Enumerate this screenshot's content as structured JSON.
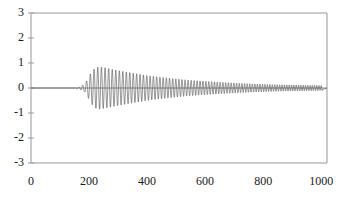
{
  "chart_data": {
    "type": "line",
    "title": "",
    "subtitle": "",
    "xlabel": "",
    "ylabel": "",
    "xlim": [
      0,
      1020
    ],
    "ylim": [
      -3,
      3
    ],
    "grid": false,
    "legend": null,
    "line_color": "#4d4d4d",
    "axis_color": "#999999",
    "background": "#ffffff",
    "x_ticks": [
      {
        "value": 0,
        "label": "0"
      },
      {
        "value": 200,
        "label": "200"
      },
      {
        "value": 400,
        "label": "400"
      },
      {
        "value": 600,
        "label": "600"
      },
      {
        "value": 800,
        "label": "800"
      },
      {
        "value": 1000,
        "label": "1000"
      }
    ],
    "y_ticks": [
      {
        "value": 3,
        "label": "3"
      },
      {
        "value": 2,
        "label": "2"
      },
      {
        "value": 1,
        "label": "1"
      },
      {
        "value": 0,
        "label": "0"
      },
      {
        "value": -1,
        "label": "-1"
      },
      {
        "value": -2,
        "label": "-2"
      },
      {
        "value": -3,
        "label": "-3"
      }
    ],
    "series": [
      {
        "name": "signal",
        "description": "Amplitude-modulated oscillation: quiet until x=165, rapid growth to peak near x=235, then slow decay with frequency increasing toward x=1000",
        "onset_x": 165,
        "peak_x": 235,
        "peak_amplitude": 0.85,
        "end_amplitude": 0.1,
        "envelope_points": [
          {
            "x": 0,
            "a": 0.0
          },
          {
            "x": 150,
            "a": 0.0
          },
          {
            "x": 165,
            "a": 0.04
          },
          {
            "x": 175,
            "a": 0.1
          },
          {
            "x": 185,
            "a": 0.16
          },
          {
            "x": 195,
            "a": 0.35
          },
          {
            "x": 205,
            "a": 0.58
          },
          {
            "x": 215,
            "a": 0.74
          },
          {
            "x": 225,
            "a": 0.82
          },
          {
            "x": 235,
            "a": 0.85
          },
          {
            "x": 250,
            "a": 0.82
          },
          {
            "x": 275,
            "a": 0.76
          },
          {
            "x": 300,
            "a": 0.7
          },
          {
            "x": 330,
            "a": 0.64
          },
          {
            "x": 360,
            "a": 0.58
          },
          {
            "x": 400,
            "a": 0.5
          },
          {
            "x": 440,
            "a": 0.44
          },
          {
            "x": 480,
            "a": 0.39
          },
          {
            "x": 520,
            "a": 0.34
          },
          {
            "x": 560,
            "a": 0.3
          },
          {
            "x": 600,
            "a": 0.27
          },
          {
            "x": 650,
            "a": 0.23
          },
          {
            "x": 700,
            "a": 0.2
          },
          {
            "x": 750,
            "a": 0.17
          },
          {
            "x": 800,
            "a": 0.15
          },
          {
            "x": 850,
            "a": 0.13
          },
          {
            "x": 900,
            "a": 0.12
          },
          {
            "x": 950,
            "a": 0.11
          },
          {
            "x": 1000,
            "a": 0.1
          }
        ],
        "frequency_points": [
          {
            "x": 150,
            "period": 13.5
          },
          {
            "x": 250,
            "period": 12.5
          },
          {
            "x": 400,
            "period": 11.5
          },
          {
            "x": 600,
            "period": 10.0
          },
          {
            "x": 800,
            "period": 8.6
          },
          {
            "x": 1000,
            "period": 7.6
          }
        ]
      }
    ]
  },
  "plot_geometry": {
    "left_px": 31,
    "right_px": 327,
    "top_px": 13,
    "bottom_px": 163,
    "zero_y_px": 88
  }
}
